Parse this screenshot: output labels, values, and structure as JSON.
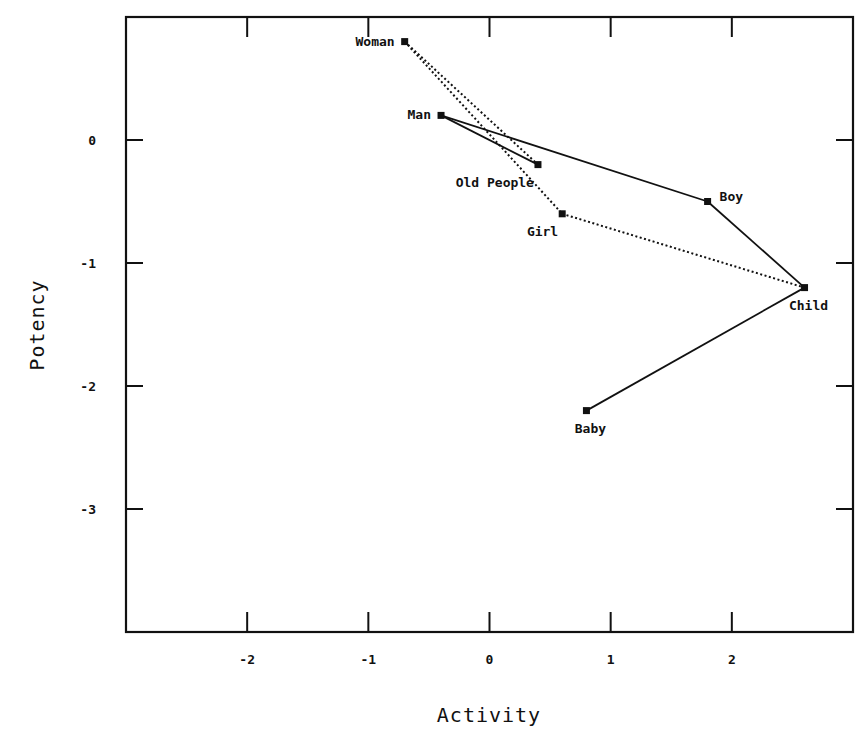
{
  "chart_data": {
    "type": "scatter",
    "title": "",
    "xlabel": "Activity",
    "ylabel": "Potency",
    "xlim": [
      -3,
      3
    ],
    "ylim": [
      -4,
      1
    ],
    "xticks": [
      -2,
      -1,
      0,
      1,
      2
    ],
    "yticks": [
      0,
      -1,
      -2,
      -3
    ],
    "xtick_labels": [
      "-2",
      "-1",
      "0",
      "1",
      "2"
    ],
    "ytick_labels": [
      "0",
      "-1",
      "-2",
      "-3"
    ],
    "grid": false,
    "legend": null,
    "points": [
      {
        "label": "Woman",
        "x": -0.7,
        "y": 0.8,
        "label_pos": "left"
      },
      {
        "label": "Man",
        "x": -0.4,
        "y": 0.2,
        "label_pos": "left"
      },
      {
        "label": "Old People",
        "x": 0.4,
        "y": -0.2,
        "label_pos": "below-left"
      },
      {
        "label": "Girl",
        "x": 0.6,
        "y": -0.6,
        "label_pos": "below-left"
      },
      {
        "label": "Boy",
        "x": 1.8,
        "y": -0.5,
        "label_pos": "right"
      },
      {
        "label": "Child",
        "x": 2.6,
        "y": -1.2,
        "label_pos": "below"
      },
      {
        "label": "Baby",
        "x": 0.8,
        "y": -2.2,
        "label_pos": "below"
      }
    ],
    "connections": [
      {
        "from": "Man",
        "to": "Boy",
        "style": "solid"
      },
      {
        "from": "Man",
        "to": "Old People",
        "style": "solid"
      },
      {
        "from": "Boy",
        "to": "Child",
        "style": "solid"
      },
      {
        "from": "Child",
        "to": "Baby",
        "style": "solid"
      },
      {
        "from": "Woman",
        "to": "Old People",
        "style": "dotted"
      },
      {
        "from": "Woman",
        "to": "Girl",
        "style": "dotted"
      },
      {
        "from": "Girl",
        "to": "Child",
        "style": "dotted"
      }
    ],
    "colors": {
      "ink": "#111111",
      "background": "#ffffff"
    }
  }
}
